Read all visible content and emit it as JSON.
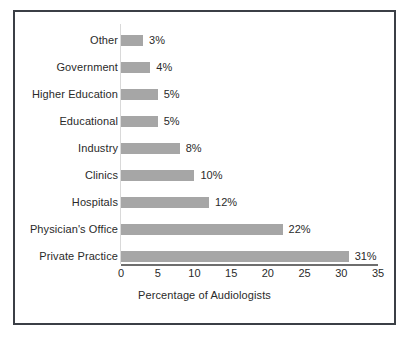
{
  "chart_data": {
    "type": "bar",
    "orientation": "horizontal",
    "title": "",
    "xlabel": "Percentage of Audiologists",
    "ylabel": "",
    "xlim": [
      0,
      35
    ],
    "xticks": [
      0,
      5,
      10,
      15,
      20,
      25,
      30,
      35
    ],
    "xtick_labels": [
      "0",
      "5",
      "10",
      "15",
      "20",
      "25",
      "30",
      "35"
    ],
    "grid": false,
    "legend": false,
    "bar_color": "#a6a6a6",
    "categories": [
      "Other",
      "Government",
      "Higher Education",
      "Educational",
      "Industry",
      "Clinics",
      "Hospitals",
      "Physician's Office",
      "Private Practice"
    ],
    "values": [
      3,
      4,
      5,
      5,
      8,
      10,
      12,
      22,
      31
    ],
    "value_labels": [
      "3%",
      "4%",
      "5%",
      "5%",
      "8%",
      "10%",
      "12%",
      "22%",
      "31%"
    ]
  },
  "caption": {
    "text": ""
  }
}
